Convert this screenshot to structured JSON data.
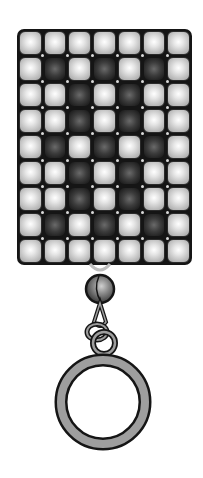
{
  "illustration": {
    "subject": "beaded keychain charm",
    "grid": {
      "columns": 7,
      "rows": 9,
      "pattern": [
        "LLLLLLL",
        "LDLDLDL",
        "LLDLDLL",
        "LLDLDLL",
        "LDLDLDL",
        "LLDLDLL",
        "LLDLDLL",
        "LDLDLDL",
        "LLLLLLL"
      ]
    },
    "colors": {
      "light_bead": "#d8d8d8",
      "dark_bead": "#3c3c3c",
      "outline": "#151515",
      "ring_fill": "#9e9e9e",
      "background": "#ffffff"
    },
    "hardware": [
      "connector-loop",
      "round-bead",
      "jump-ring",
      "key-ring"
    ]
  }
}
